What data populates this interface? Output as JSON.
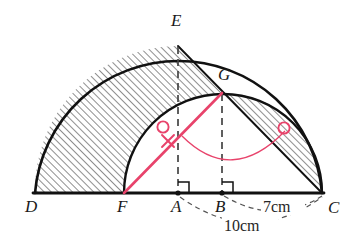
{
  "figure": {
    "points": {
      "D": {
        "label": "D",
        "x": 35,
        "y": 193,
        "label_x": 25,
        "label_y": 212
      },
      "F": {
        "label": "F",
        "x": 124,
        "y": 193,
        "label_x": 117,
        "label_y": 212
      },
      "A": {
        "label": "A",
        "x": 178,
        "y": 193,
        "label_x": 171,
        "label_y": 212
      },
      "B": {
        "label": "B",
        "x": 222,
        "y": 193,
        "label_x": 215,
        "label_y": 212
      },
      "C": {
        "label": "C",
        "x": 322,
        "y": 193,
        "label_x": 328,
        "label_y": 213
      },
      "E": {
        "label": "E",
        "x": 178,
        "y": 46,
        "label_x": 171,
        "label_y": 22
      },
      "G": {
        "label": "G",
        "x": 222,
        "y": 93,
        "label_x": 222,
        "label_y": 78
      }
    },
    "dimensions": [
      {
        "name": "bc-measure",
        "text": "7cm",
        "x": 283,
        "y": 211,
        "from": "B",
        "to": "C"
      },
      {
        "name": "ac-measure",
        "text": "10cm",
        "x": 249,
        "y": 230,
        "from": "A",
        "to": "C"
      }
    ],
    "semicircles": [
      {
        "name": "large-semicircle",
        "center_x": 178,
        "center_y": 193,
        "radius": 144,
        "from": "D",
        "to": "C",
        "apex": "E"
      },
      {
        "name": "small-semicircle",
        "center_x": 222,
        "center_y": 193,
        "radius": 99,
        "from": "F",
        "to": "C",
        "apex": "G"
      }
    ],
    "baseline": {
      "name": "baseline-DC",
      "x1": 33,
      "y1": 193,
      "x2": 324,
      "y2": 193
    },
    "dashed_lines": [
      {
        "name": "dashed-EA",
        "x1": 178,
        "y1": 46,
        "x2": 178,
        "y2": 191
      },
      {
        "name": "dashed-GB",
        "x1": 222,
        "y1": 93,
        "x2": 222,
        "y2": 191
      }
    ],
    "solid_line": {
      "name": "line-EC",
      "x1": 178,
      "y1": 46,
      "x2": 322,
      "y2": 193
    },
    "right_angles": [
      {
        "name": "right-angle-A",
        "x": 178,
        "y": 193,
        "size": 11
      },
      {
        "name": "right-angle-B",
        "x": 222,
        "y": 193,
        "size": 11
      }
    ],
    "red_marks": {
      "color": "#e8436b",
      "line": {
        "name": "red-line-FG",
        "x1": 124,
        "y1": 193,
        "x2": 222,
        "y2": 93
      },
      "arc": {
        "name": "red-angle-arc",
        "start_x": 182,
        "start_y": 136,
        "end_x": 285,
        "end_y": 131,
        "sweep_y": 170
      },
      "cross": {
        "name": "red-cross-mark",
        "x": 168,
        "y": 141,
        "size": 8
      },
      "circles": [
        {
          "name": "red-circle-left",
          "x": 163,
          "y": 127,
          "r": 6
        },
        {
          "name": "red-circle-right",
          "x": 284,
          "y": 128,
          "r": 6
        }
      ]
    },
    "hatching": {
      "name": "hatch-pattern",
      "angle_deg": 45,
      "spacing_px": 5,
      "color": "#3a3a3a",
      "regions": [
        {
          "name": "hatch-region-left",
          "description": "Area between large arc D-E and small arc F-G, above baseline D-F"
        },
        {
          "name": "hatch-region-right",
          "description": "Lune between line G-C and small arc G-C"
        }
      ]
    },
    "colors": {
      "ink": "#111111",
      "accent_red": "#e8436b",
      "dashed_gray": "#555555",
      "background": "#ffffff"
    }
  }
}
